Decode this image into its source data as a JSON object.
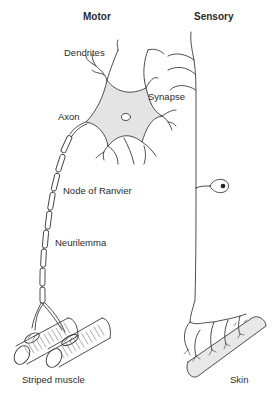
{
  "diagram": {
    "columns": {
      "motor": "Motor",
      "sensory": "Sensory"
    },
    "labels": {
      "dendrites": "Dendrites",
      "synapse": "Synapse",
      "axon": "Axon",
      "node_of_ranvier": "Node of Ranvier",
      "neurilemma": "Neurilemma",
      "striped_muscle": "Striped muscle",
      "skin": "Skin"
    },
    "colors": {
      "line": "#3a3a3a",
      "cell_body_fill": "#e4e4e4",
      "skin_fill": "#e8e8e8",
      "nucleus_fill": "#222222",
      "background": "#ffffff"
    }
  }
}
